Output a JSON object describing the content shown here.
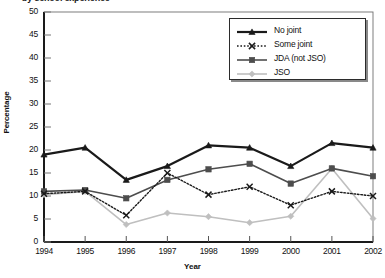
{
  "figure": {
    "cut_title": "by school experience",
    "y_axis_title": "Percentage",
    "x_axis_title": "Year"
  },
  "chart_data": {
    "type": "line",
    "title": "by school experience",
    "xlabel": "Year",
    "ylabel": "Percentage",
    "categories": [
      "1994",
      "1995",
      "1996",
      "1997",
      "1998",
      "1999",
      "2000",
      "2001",
      "2002"
    ],
    "x": [
      1994,
      1995,
      1996,
      1997,
      1998,
      1999,
      2000,
      2001,
      2002
    ],
    "xlim": [
      1994,
      2002
    ],
    "ylim": [
      0,
      50
    ],
    "yticks": [
      0,
      5,
      10,
      15,
      20,
      25,
      30,
      35,
      40,
      45,
      50
    ],
    "grid": false,
    "legend_position": "top-right",
    "series": [
      {
        "name": "No joint",
        "color": "#1a1a1a",
        "marker": "triangle",
        "dash": "solid",
        "width": 2.2,
        "values": [
          19.0,
          20.5,
          13.5,
          16.5,
          21.0,
          20.5,
          16.5,
          21.5,
          20.5
        ]
      },
      {
        "name": "Some joint",
        "color": "#1a1a1a",
        "marker": "x",
        "dash": "dotted",
        "width": 1.4,
        "values": [
          10.5,
          11.0,
          5.8,
          15.0,
          10.3,
          12.0,
          8.0,
          11.0,
          10.0
        ]
      },
      {
        "name": "JDA (not JSO)",
        "color": "#4d4d4d",
        "marker": "square",
        "dash": "solid",
        "width": 1.6,
        "values": [
          11.0,
          11.3,
          9.5,
          13.5,
          15.8,
          17.0,
          12.7,
          16.0,
          14.3
        ]
      },
      {
        "name": "JSO",
        "color": "#bfbfbf",
        "marker": "diamond",
        "dash": "solid",
        "width": 1.6,
        "values": [
          10.3,
          11.0,
          3.8,
          6.3,
          5.5,
          4.2,
          5.6,
          16.0,
          5.1
        ]
      }
    ]
  },
  "legend": {
    "items": [
      {
        "label": "No joint"
      },
      {
        "label": "Some joint"
      },
      {
        "label": "JDA (not JSO)"
      },
      {
        "label": "JSO"
      }
    ]
  },
  "axes": {
    "y_tick_labels": [
      "50",
      "45",
      "40",
      "35",
      "30",
      "25",
      "20",
      "15",
      "10",
      "5",
      "0"
    ],
    "x_tick_labels": [
      "1994",
      "1995",
      "1996",
      "1997",
      "1998",
      "1999",
      "2000",
      "2001",
      "2002"
    ]
  }
}
